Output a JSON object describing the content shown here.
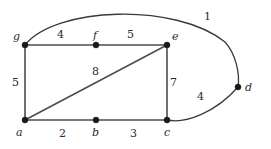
{
  "figure": {
    "background_color": "#ffffff",
    "edge_color": "#4d4d4d",
    "vertex_color": "#1a1a1a",
    "text_color": "#2b2b2b"
  },
  "vertices": [
    {
      "id": "g",
      "label": "g",
      "x": 25,
      "y": 45,
      "label_x": 13,
      "label_y": 31
    },
    {
      "id": "f",
      "label": "f",
      "x": 96,
      "y": 45,
      "label_x": 93,
      "label_y": 30
    },
    {
      "id": "e",
      "label": "e",
      "x": 167,
      "y": 45,
      "label_x": 172,
      "label_y": 31
    },
    {
      "id": "d",
      "label": "d",
      "x": 238,
      "y": 87,
      "label_x": 245,
      "label_y": 82
    },
    {
      "id": "a",
      "label": "a",
      "x": 25,
      "y": 120,
      "label_x": 16,
      "label_y": 127
    },
    {
      "id": "b",
      "label": "b",
      "x": 96,
      "y": 120,
      "label_x": 92,
      "label_y": 127
    },
    {
      "id": "c",
      "label": "c",
      "x": 167,
      "y": 120,
      "label_x": 164,
      "label_y": 127
    }
  ],
  "edges": [
    {
      "id": "g-f",
      "from": "g",
      "to": "f",
      "weight": "4",
      "shape": "line",
      "weight_x": 57,
      "weight_y": 29
    },
    {
      "id": "f-e",
      "from": "f",
      "to": "e",
      "weight": "5",
      "shape": "line",
      "weight_x": 127,
      "weight_y": 29
    },
    {
      "id": "g-a",
      "from": "g",
      "to": "a",
      "weight": "5",
      "shape": "line",
      "weight_x": 12,
      "weight_y": 77
    },
    {
      "id": "a-e",
      "from": "a",
      "to": "e",
      "weight": "8",
      "shape": "line",
      "weight_x": 92,
      "weight_y": 66
    },
    {
      "id": "e-c",
      "from": "e",
      "to": "c",
      "weight": "7",
      "shape": "line",
      "weight_x": 170,
      "weight_y": 77
    },
    {
      "id": "a-b",
      "from": "a",
      "to": "b",
      "weight": "2",
      "shape": "line",
      "weight_x": 59,
      "weight_y": 128
    },
    {
      "id": "b-c",
      "from": "b",
      "to": "c",
      "weight": "3",
      "shape": "line",
      "weight_x": 130,
      "weight_y": 128
    },
    {
      "id": "g-d",
      "from": "g",
      "to": "d",
      "weight": "1",
      "shape": "curve",
      "weight_x": 204,
      "weight_y": 11
    },
    {
      "id": "c-d",
      "from": "c",
      "to": "d",
      "weight": "4",
      "shape": "curve",
      "weight_x": 197,
      "weight_y": 91
    }
  ]
}
